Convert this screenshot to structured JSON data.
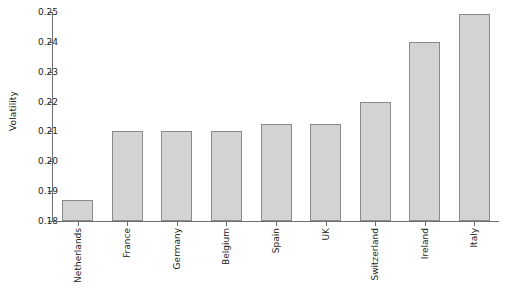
{
  "chart_data": {
    "type": "bar",
    "title": "",
    "xlabel": "",
    "ylabel": "Volatility",
    "ylim": [
      0.18,
      0.25
    ],
    "yticks": [
      "0.18",
      "0.19",
      "0.20",
      "0.21",
      "0.22",
      "0.23",
      "0.24",
      "0.25"
    ],
    "ytick_values": [
      0.18,
      0.19,
      0.2,
      0.21,
      0.22,
      0.23,
      0.24,
      0.25
    ],
    "grid": false,
    "legend": false,
    "categories": [
      "Netherlands",
      "France",
      "Germany",
      "Belgium",
      "Spain",
      "UK",
      "Switzerland",
      "Ireland",
      "Italy"
    ],
    "values": [
      0.187,
      0.21,
      0.21,
      0.21,
      0.2125,
      0.2125,
      0.22,
      0.24,
      0.2495
    ],
    "bar_color": "#d3d3d3",
    "bar_edge_color": "#8a8a8a",
    "axis_color": "#6d6e71",
    "text_color": "#231f20",
    "background": "#ffffff"
  }
}
